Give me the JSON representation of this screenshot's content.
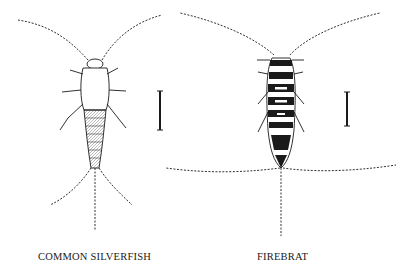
{
  "figure": {
    "specimens": [
      {
        "id": "silverfish",
        "label": "COMMON SILVERFISH",
        "scale_bar": "size reference bar"
      },
      {
        "id": "firebrat",
        "label": "FIREBRAT",
        "scale_bar": "size reference bar"
      }
    ],
    "colors": {
      "ink": "#1a1a1a",
      "background": "#ffffff"
    }
  }
}
